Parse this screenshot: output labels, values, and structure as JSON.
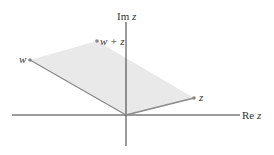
{
  "figure": {
    "axes": {
      "real_label": "Re z",
      "imag_label": "Im z"
    },
    "points": {
      "w": "w",
      "z": "z",
      "sum": "w + z"
    },
    "colors": {
      "axis": "#222222",
      "edge": "#8a8a8a",
      "fill": "#e9e9e9",
      "point": "#888888"
    }
  }
}
